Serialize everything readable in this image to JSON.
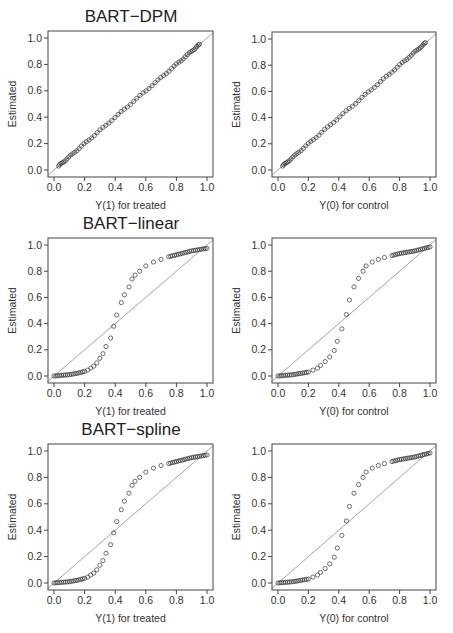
{
  "figure": {
    "width": 453,
    "height": 633,
    "row_titles": [
      "BART−DPM",
      "BART−linear",
      "BART−spline"
    ]
  },
  "chart_data": [
    {
      "type": "scatter",
      "title": "BART−DPM",
      "xlabel": "Y(1) for treated",
      "ylabel": "Estimated",
      "xticks": [
        "0.0",
        "0.2",
        "0.4",
        "0.6",
        "0.8",
        "1.0"
      ],
      "yticks": [
        "0.0",
        "0.2",
        "0.4",
        "0.6",
        "0.8",
        "1.0"
      ],
      "xlim": [
        0,
        1
      ],
      "ylim": [
        0,
        1
      ],
      "reference_line": "y = x",
      "shape": "identity",
      "x_range": [
        0.03,
        0.95
      ],
      "grid": false
    },
    {
      "type": "scatter",
      "title": "",
      "xlabel": "Y(0) for control",
      "ylabel": "Estimated",
      "xticks": [
        "0.0",
        "0.2",
        "0.4",
        "0.6",
        "0.8",
        "1.0"
      ],
      "yticks": [
        "0.0",
        "0.2",
        "0.4",
        "0.6",
        "0.8",
        "1.0"
      ],
      "xlim": [
        0,
        1
      ],
      "ylim": [
        0,
        1
      ],
      "reference_line": "y = x",
      "shape": "identity",
      "x_range": [
        0.03,
        0.97
      ],
      "grid": false
    },
    {
      "type": "scatter",
      "title": "BART−linear",
      "xlabel": "Y(1) for treated",
      "ylabel": "Estimated",
      "xticks": [
        "0.0",
        "0.2",
        "0.4",
        "0.6",
        "0.8",
        "1.0"
      ],
      "yticks": [
        "0.0",
        "0.2",
        "0.4",
        "0.6",
        "0.8",
        "1.0"
      ],
      "xlim": [
        0,
        1
      ],
      "ylim": [
        0,
        1
      ],
      "reference_line": "y = x",
      "shape": "sigmoid",
      "points": [
        [
          0.0,
          0.0
        ],
        [
          0.05,
          0.005
        ],
        [
          0.1,
          0.01
        ],
        [
          0.15,
          0.02
        ],
        [
          0.2,
          0.035
        ],
        [
          0.22,
          0.045
        ],
        [
          0.24,
          0.06
        ],
        [
          0.26,
          0.075
        ],
        [
          0.28,
          0.1
        ],
        [
          0.3,
          0.135
        ],
        [
          0.32,
          0.17
        ],
        [
          0.34,
          0.225
        ],
        [
          0.37,
          0.29
        ],
        [
          0.39,
          0.38
        ],
        [
          0.41,
          0.465
        ],
        [
          0.44,
          0.56
        ],
        [
          0.46,
          0.62
        ],
        [
          0.49,
          0.68
        ],
        [
          0.51,
          0.74
        ],
        [
          0.53,
          0.77
        ],
        [
          0.56,
          0.8
        ],
        [
          0.6,
          0.84
        ],
        [
          0.65,
          0.87
        ],
        [
          0.7,
          0.89
        ],
        [
          0.75,
          0.91
        ],
        [
          0.8,
          0.925
        ],
        [
          0.85,
          0.94
        ],
        [
          0.9,
          0.955
        ],
        [
          0.95,
          0.965
        ],
        [
          1.0,
          0.975
        ]
      ],
      "grid": false
    },
    {
      "type": "scatter",
      "title": "",
      "xlabel": "Y(0) for control",
      "ylabel": "Estimated",
      "xticks": [
        "0.0",
        "0.2",
        "0.4",
        "0.6",
        "0.8",
        "1.0"
      ],
      "yticks": [
        "0.0",
        "0.2",
        "0.4",
        "0.6",
        "0.8",
        "1.0"
      ],
      "xlim": [
        0,
        1
      ],
      "ylim": [
        0,
        1
      ],
      "reference_line": "y = x",
      "shape": "sigmoid",
      "points": [
        [
          0.0,
          0.0
        ],
        [
          0.05,
          0.005
        ],
        [
          0.1,
          0.01
        ],
        [
          0.15,
          0.02
        ],
        [
          0.2,
          0.03
        ],
        [
          0.23,
          0.045
        ],
        [
          0.26,
          0.06
        ],
        [
          0.28,
          0.08
        ],
        [
          0.31,
          0.11
        ],
        [
          0.34,
          0.145
        ],
        [
          0.37,
          0.195
        ],
        [
          0.39,
          0.265
        ],
        [
          0.42,
          0.36
        ],
        [
          0.45,
          0.47
        ],
        [
          0.47,
          0.58
        ],
        [
          0.5,
          0.68
        ],
        [
          0.53,
          0.745
        ],
        [
          0.56,
          0.8
        ],
        [
          0.58,
          0.84
        ],
        [
          0.62,
          0.87
        ],
        [
          0.66,
          0.89
        ],
        [
          0.7,
          0.905
        ],
        [
          0.75,
          0.92
        ],
        [
          0.8,
          0.935
        ],
        [
          0.85,
          0.945
        ],
        [
          0.9,
          0.955
        ],
        [
          0.95,
          0.97
        ],
        [
          1.0,
          0.985
        ]
      ],
      "grid": false
    },
    {
      "type": "scatter",
      "title": "BART−spline",
      "xlabel": "Y(1) for treated",
      "ylabel": "Estimated",
      "xticks": [
        "0.0",
        "0.2",
        "0.4",
        "0.6",
        "0.8",
        "1.0"
      ],
      "yticks": [
        "0.0",
        "0.2",
        "0.4",
        "0.6",
        "0.8",
        "1.0"
      ],
      "xlim": [
        0,
        1
      ],
      "ylim": [
        0,
        1
      ],
      "reference_line": "y = x",
      "shape": "sigmoid",
      "points": [
        [
          0.0,
          0.0
        ],
        [
          0.05,
          0.005
        ],
        [
          0.1,
          0.01
        ],
        [
          0.15,
          0.02
        ],
        [
          0.2,
          0.035
        ],
        [
          0.22,
          0.045
        ],
        [
          0.24,
          0.06
        ],
        [
          0.26,
          0.075
        ],
        [
          0.28,
          0.1
        ],
        [
          0.3,
          0.135
        ],
        [
          0.32,
          0.17
        ],
        [
          0.34,
          0.225
        ],
        [
          0.37,
          0.29
        ],
        [
          0.39,
          0.38
        ],
        [
          0.41,
          0.465
        ],
        [
          0.44,
          0.555
        ],
        [
          0.46,
          0.62
        ],
        [
          0.49,
          0.68
        ],
        [
          0.51,
          0.74
        ],
        [
          0.53,
          0.77
        ],
        [
          0.56,
          0.8
        ],
        [
          0.6,
          0.84
        ],
        [
          0.65,
          0.87
        ],
        [
          0.7,
          0.89
        ],
        [
          0.75,
          0.905
        ],
        [
          0.8,
          0.92
        ],
        [
          0.85,
          0.935
        ],
        [
          0.9,
          0.95
        ],
        [
          0.95,
          0.96
        ],
        [
          1.0,
          0.97
        ]
      ],
      "grid": false
    },
    {
      "type": "scatter",
      "title": "",
      "xlabel": "Y(0) for control",
      "ylabel": "Estimated",
      "xticks": [
        "0.0",
        "0.2",
        "0.4",
        "0.6",
        "0.8",
        "1.0"
      ],
      "yticks": [
        "0.0",
        "0.2",
        "0.4",
        "0.6",
        "0.8",
        "1.0"
      ],
      "xlim": [
        0,
        1
      ],
      "ylim": [
        0,
        1
      ],
      "reference_line": "y = x",
      "shape": "sigmoid",
      "points": [
        [
          0.0,
          0.0
        ],
        [
          0.05,
          0.005
        ],
        [
          0.1,
          0.01
        ],
        [
          0.15,
          0.02
        ],
        [
          0.2,
          0.03
        ],
        [
          0.23,
          0.045
        ],
        [
          0.26,
          0.06
        ],
        [
          0.28,
          0.08
        ],
        [
          0.31,
          0.11
        ],
        [
          0.34,
          0.145
        ],
        [
          0.37,
          0.195
        ],
        [
          0.39,
          0.265
        ],
        [
          0.42,
          0.36
        ],
        [
          0.45,
          0.47
        ],
        [
          0.47,
          0.58
        ],
        [
          0.5,
          0.68
        ],
        [
          0.53,
          0.745
        ],
        [
          0.56,
          0.8
        ],
        [
          0.58,
          0.84
        ],
        [
          0.62,
          0.87
        ],
        [
          0.66,
          0.89
        ],
        [
          0.7,
          0.905
        ],
        [
          0.75,
          0.92
        ],
        [
          0.8,
          0.935
        ],
        [
          0.85,
          0.945
        ],
        [
          0.9,
          0.955
        ],
        [
          0.95,
          0.97
        ],
        [
          1.0,
          0.985
        ]
      ],
      "grid": false
    }
  ]
}
